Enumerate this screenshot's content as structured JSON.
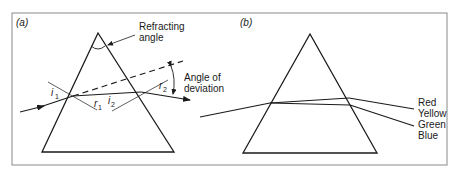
{
  "figure": {
    "frame_color": "#7a7a7a",
    "line_color": "#1a1a1a",
    "panels": [
      {
        "id": "a",
        "label": "(a)",
        "annotations": {
          "refracting_angle_line1": "Refracting",
          "refracting_angle_line2": "angle",
          "deviation_line1": "Angle of",
          "deviation_line2": "deviation"
        },
        "angle_labels": {
          "i1": {
            "base": "i",
            "sub": "1"
          },
          "r1": {
            "base": "r",
            "sub": "1"
          },
          "i2": {
            "base": "i",
            "sub": "2"
          },
          "r2": {
            "base": "r",
            "sub": "2"
          }
        }
      },
      {
        "id": "b",
        "label": "(b)",
        "spectrum": [
          "Red",
          "Yellow",
          "Green",
          "Blue"
        ]
      }
    ]
  }
}
